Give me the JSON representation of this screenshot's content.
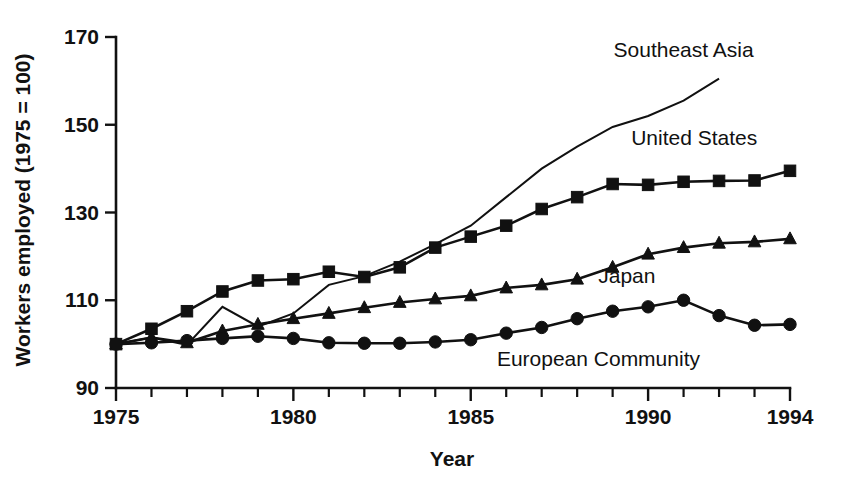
{
  "chart_data": {
    "type": "line",
    "title": "",
    "subtitle": "",
    "xlabel": "Year",
    "ylabel": "Workers employed (1975 = 100)",
    "xlim": [
      1975,
      1994
    ],
    "ylim": [
      90,
      170
    ],
    "grid": false,
    "legend_position": "inline-right-of-series",
    "x_tick_labels": [
      "1975",
      "1980",
      "1985",
      "1990",
      "1994"
    ],
    "x_tick_values": [
      1975,
      1980,
      1985,
      1990,
      1994
    ],
    "x_minor_ticks": [
      1976,
      1977,
      1978,
      1979,
      1981,
      1982,
      1983,
      1984,
      1986,
      1987,
      1988,
      1989,
      1991,
      1992,
      1993
    ],
    "y_tick_labels": [
      "90",
      "110",
      "130",
      "150",
      "170"
    ],
    "y_tick_values": [
      90,
      110,
      130,
      150,
      170
    ],
    "x": [
      1975,
      1976,
      1977,
      1978,
      1979,
      1980,
      1981,
      1982,
      1983,
      1984,
      1985,
      1986,
      1987,
      1988,
      1989,
      1990,
      1991,
      1992,
      1993,
      1994
    ],
    "series": [
      {
        "name": "Southeast Asia",
        "marker": "none",
        "label": "Southeast Asia",
        "x": [
          1975,
          1976,
          1977,
          1978,
          1979,
          1980,
          1981,
          1982,
          1983,
          1984,
          1985,
          1986,
          1987,
          1988,
          1989,
          1990,
          1991,
          1992
        ],
        "values": [
          100.0,
          101.5,
          99.8,
          108.5,
          104.0,
          107.0,
          113.5,
          115.5,
          118.8,
          122.8,
          127.0,
          133.5,
          140.0,
          145.0,
          149.5,
          152.0,
          155.5,
          160.5
        ]
      },
      {
        "name": "United States",
        "marker": "square",
        "label": "United States",
        "x": [
          1975,
          1976,
          1977,
          1978,
          1979,
          1980,
          1981,
          1982,
          1983,
          1984,
          1985,
          1986,
          1987,
          1988,
          1989,
          1990,
          1991,
          1992,
          1993,
          1994
        ],
        "values": [
          100.0,
          103.5,
          107.5,
          112.0,
          114.5,
          114.8,
          116.5,
          115.3,
          117.5,
          122.0,
          124.5,
          127.0,
          130.8,
          133.5,
          136.5,
          136.3,
          137.0,
          137.2,
          137.3,
          139.5
        ]
      },
      {
        "name": "Japan",
        "marker": "triangle",
        "label": "Japan",
        "x": [
          1975,
          1976,
          1977,
          1978,
          1979,
          1980,
          1981,
          1982,
          1983,
          1984,
          1985,
          1986,
          1987,
          1988,
          1989,
          1990,
          1991,
          1992,
          1993,
          1994
        ],
        "values": [
          100.0,
          101.5,
          100.3,
          103.0,
          104.5,
          105.8,
          107.0,
          108.3,
          109.5,
          110.3,
          111.0,
          112.8,
          113.5,
          114.8,
          117.5,
          120.5,
          122.0,
          123.0,
          123.3,
          124.0
        ]
      },
      {
        "name": "European Community",
        "marker": "circle",
        "label": "European Community",
        "x": [
          1975,
          1976,
          1977,
          1978,
          1979,
          1980,
          1981,
          1982,
          1983,
          1984,
          1985,
          1986,
          1987,
          1988,
          1989,
          1990,
          1991,
          1992,
          1993,
          1994
        ],
        "values": [
          100.0,
          100.3,
          100.8,
          101.3,
          101.8,
          101.3,
          100.3,
          100.2,
          100.2,
          100.5,
          101.0,
          102.5,
          103.8,
          105.8,
          107.5,
          108.5,
          110.0,
          106.5,
          104.3,
          104.5
        ]
      }
    ],
    "annotations": [
      {
        "text": "Southeast Asia",
        "x": 1991.0,
        "y": 167.0,
        "anchor": "middle"
      },
      {
        "text": "United States",
        "x": 1991.3,
        "y": 147.0,
        "anchor": "middle"
      },
      {
        "text": "Japan",
        "x": 1989.4,
        "y": 115.5,
        "anchor": "middle"
      },
      {
        "text": "European Community",
        "x": 1988.6,
        "y": 96.5,
        "anchor": "middle"
      }
    ],
    "colors": {
      "ink": "#111111",
      "background": "#ffffff"
    }
  }
}
